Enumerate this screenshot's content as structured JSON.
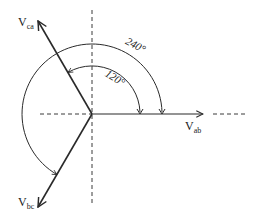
{
  "diagram": {
    "origin": {
      "x": 92,
      "y": 114
    },
    "colors": {
      "stroke": "#2a2a2a",
      "dashed": "#3a3a3a",
      "background": "#ffffff"
    },
    "phasors": [
      {
        "id": "vab",
        "label_main": "V",
        "label_sub": "ab",
        "angle_deg": 0
      },
      {
        "id": "vca",
        "label_main": "V",
        "label_sub": "ca",
        "angle_deg": 120
      },
      {
        "id": "vbc",
        "label_main": "V",
        "label_sub": "bc",
        "angle_deg": 240
      }
    ],
    "arcs": [
      {
        "id": "arc-120",
        "label": "120°",
        "radius": 48,
        "from_deg": 0,
        "to_deg": 120
      },
      {
        "id": "arc-240",
        "label": "240°",
        "radius": 70,
        "from_deg": 0,
        "to_deg": 240
      }
    ],
    "axes": {
      "vertical": "dashed",
      "horizontal_left": "dashed",
      "horizontal_right_extension": "dashed"
    }
  }
}
